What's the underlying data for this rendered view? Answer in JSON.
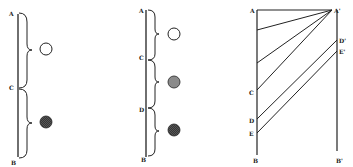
{
  "colors": {
    "ink": "#222222",
    "light_gray": "#9a9a9a",
    "dark_gray": "#4a4a4a",
    "background": "#ffffff"
  },
  "figure1": {
    "labels": {
      "top": "A",
      "middle": "C",
      "bottom": "B"
    },
    "circles": [
      {
        "fill": "white"
      },
      {
        "fill": "dark-hatched"
      }
    ]
  },
  "figure2": {
    "labels": {
      "top": "A",
      "c": "C",
      "d": "D",
      "bottom": "B"
    },
    "circles": [
      {
        "fill": "white"
      },
      {
        "fill": "medium-gray"
      },
      {
        "fill": "dark-hatched"
      }
    ]
  },
  "figure3": {
    "labels": {
      "a": "A",
      "a_prime": "A'",
      "c": "C",
      "d": "D",
      "e": "E",
      "b": "B",
      "d_prime": "D'",
      "e_prime": "E'",
      "b_prime": "B'"
    }
  }
}
